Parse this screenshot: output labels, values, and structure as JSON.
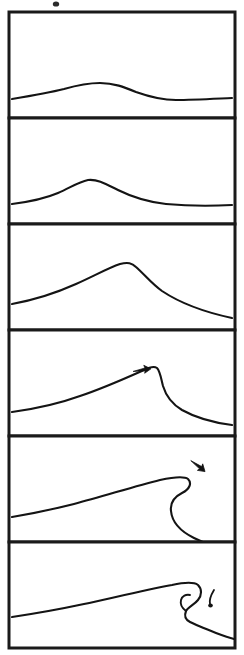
{
  "figure": {
    "panel_count": 6,
    "line_color": "#141414",
    "frame_color": "#1a1a1a",
    "background_color": "#ffffff",
    "stroke_width_px": 2.1
  },
  "layout": {
    "canvas_width": 244,
    "canvas_height": 655,
    "frame_left": 9,
    "frame_right": 235,
    "frame_top": 12,
    "frame_bottom": 648,
    "panel_height": 106
  },
  "panels": [
    {
      "index": 1,
      "name": "panel-swell",
      "stage_label": "low-amplitude swell",
      "frame": {
        "x": 9,
        "y": 12,
        "width": 226,
        "height": 106
      },
      "crest_x": 88,
      "crest_height_px": 16,
      "symmetry": "symmetric",
      "steepness": "very low",
      "has_arrow": false,
      "has_droplet": false,
      "profile_path": "M 12 99 C 30 96 48 93 64 89 C 78 85 88 83 100 83 C 114 83 124 87 136 92 C 150 97 162 100 176 100 C 192 100 210 99 232 98"
    },
    {
      "index": 2,
      "name": "panel-growing",
      "stage_label": "growing amplitude",
      "frame": {
        "x": 9,
        "y": 118,
        "width": 226,
        "height": 106
      },
      "crest_x": 84,
      "crest_height_px": 24,
      "symmetry": "near symmetric",
      "steepness": "low",
      "has_arrow": false,
      "has_droplet": false,
      "profile_path": "M 12 204 C 28 202 44 199 58 193 C 70 188 78 182 88 180 C 98 179 106 184 118 190 C 132 197 148 202 166 204 C 188 206 212 206 232 205"
    },
    {
      "index": 3,
      "name": "panel-steepening",
      "stage_label": "steepening crest",
      "frame": {
        "x": 9,
        "y": 224,
        "width": 226,
        "height": 106
      },
      "crest_x": 122,
      "crest_height_px": 40,
      "symmetry": "slightly asymmetric",
      "steepness": "moderate",
      "has_arrow": false,
      "has_droplet": false,
      "profile_path": "M 12 304 C 34 300 56 293 76 284 C 94 276 108 268 120 264 C 128 262 132 263 136 267 C 144 274 152 284 162 291 C 180 303 204 312 232 318"
    },
    {
      "index": 4,
      "name": "panel-peaking",
      "stage_label": "peaking, vertical front face",
      "frame": {
        "x": 9,
        "y": 330,
        "width": 226,
        "height": 106
      },
      "crest_x": 156,
      "crest_height_px": 52,
      "symmetry": "strongly asymmetric",
      "steepness": "high",
      "has_arrow": true,
      "arrow": {
        "name": "velocity-arrow-panel4",
        "x": 142,
        "y": 370,
        "direction": "right",
        "angle_deg": -8
      },
      "has_droplet": false,
      "profile_path": "M 12 412 C 34 409 58 404 80 396 C 104 388 126 378 144 370 C 150 367 154 366 157 368 C 160 371 161 378 163 386 C 166 396 172 404 182 410 C 198 419 216 423 232 425"
    },
    {
      "index": 5,
      "name": "panel-overturning",
      "stage_label": "overturning lip",
      "frame": {
        "x": 9,
        "y": 436,
        "width": 226,
        "height": 106
      },
      "crest_x": 186,
      "crest_height_px": 66,
      "symmetry": "overturned",
      "steepness": "breaking",
      "has_arrow": true,
      "arrow": {
        "name": "velocity-arrow-panel5",
        "x": 198,
        "y": 466,
        "direction": "down-right",
        "angle_deg": 38
      },
      "has_droplet": false,
      "profile_path": "M 12 517 C 30 514 50 510 74 504 C 104 496 136 486 160 480 C 174 477 184 476 188 479 C 192 483 190 489 182 493 C 174 497 170 503 171 511 C 172 522 180 531 194 538 C 208 545 222 549 234 551"
    },
    {
      "index": 6,
      "name": "panel-plunging",
      "stage_label": "plunging breaker with barrel",
      "frame": {
        "x": 9,
        "y": 542,
        "width": 226,
        "height": 106
      },
      "crest_x": 196,
      "crest_height_px": 74,
      "symmetry": "plunging jet",
      "steepness": "broken",
      "has_arrow": false,
      "has_droplet": true,
      "droplet": {
        "name": "spray-droplet-panel6",
        "x": 212,
        "y": 600
      },
      "profile_path": "M 12 617 C 32 614 56 610 84 604 C 116 597 150 589 172 585 C 186 582 194 582 198 585 C 202 589 202 595 198 600 C 194 605 188 607 186 611 C 184 616 186 620 190 622 C 196 625 206 629 216 633 C 224 636 230 638 234 639",
      "inner_path": "M 186 611 C 182 608 180 604 181 600 C 182 596 186 594 190 595"
    }
  ],
  "annotations": {
    "arrow_meaning": "wave propagation direction",
    "arrow_count": 2,
    "droplet_count": 1
  }
}
